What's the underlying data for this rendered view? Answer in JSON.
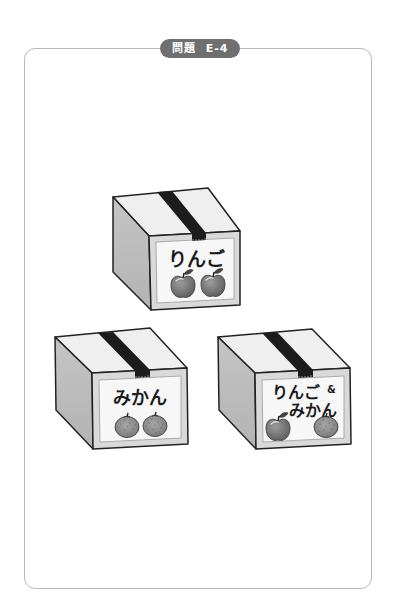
{
  "header": {
    "badge_prefix": "問題",
    "badge_code": "E-4",
    "badge_color": "#6f6f6f"
  },
  "boxes": [
    {
      "id": "apple-box",
      "label": "りんご",
      "contents": [
        "apple",
        "apple"
      ],
      "position": "top-center"
    },
    {
      "id": "orange-box",
      "label": "みかん",
      "contents": [
        "mikan",
        "mikan"
      ],
      "position": "bottom-left"
    },
    {
      "id": "mixed-box",
      "label_line1": "りんご",
      "label_amp": "&",
      "label_line2": "みかん",
      "contents": [
        "apple",
        "mikan"
      ],
      "position": "bottom-right"
    }
  ],
  "colors": {
    "panel_border": "#b9b9b9",
    "box_top": "#efefef",
    "box_side": "#bdbdbd",
    "box_front": "#d9d9d9",
    "label_bg": "#f7f7f7",
    "tape": "#1c1c1c",
    "fruit_fill": "#7a7a7a",
    "mikan_fill": "#8c8c8c"
  }
}
